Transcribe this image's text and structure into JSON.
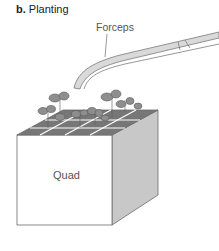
{
  "figure": {
    "panel_letter": "b.",
    "panel_title": "Planting",
    "labels": {
      "forceps": "Forceps",
      "quad": "Quad"
    },
    "colors": {
      "outline": "#6b6b6b",
      "side_face": "#c8c8c8",
      "soil": "#777777",
      "leaf": "#8e8e8e",
      "forceps_fill": "#d9d9d9"
    }
  }
}
